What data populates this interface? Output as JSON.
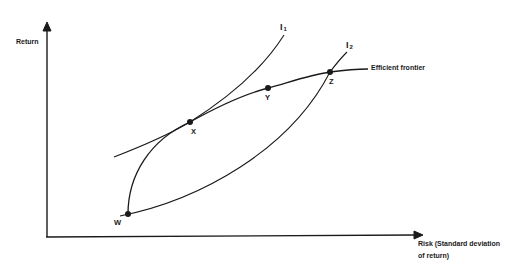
{
  "diagram": {
    "type": "mean-variance efficient frontier with indifference curves",
    "axes": {
      "y_label": "Return",
      "x_label_line1": "Risk (Standard deviation",
      "x_label_line2": "of return)"
    },
    "curves": {
      "efficient_frontier": "Efficient frontier",
      "indifference_1": {
        "letter": "I",
        "sub": "1"
      },
      "indifference_2": {
        "letter": "I",
        "sub": "2"
      }
    },
    "points": {
      "w": "W",
      "x": "X",
      "y": "Y",
      "z": "Z"
    },
    "colors": {
      "ink": "#1a1a1a",
      "background": "#ffffff"
    }
  }
}
